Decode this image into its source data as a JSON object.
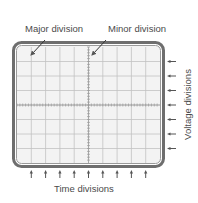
{
  "labels": {
    "major_division": "Major division",
    "minor_division": "Minor division",
    "time_divisions": "Time divisions",
    "voltage_divisions": "Voltage divisions"
  },
  "graticule": {
    "columns": 10,
    "rows": 8,
    "time_arrow_count": 9,
    "voltage_arrow_count": 7
  },
  "colors": {
    "bezel": "#6e6e6e",
    "screen": "#f3f3f3",
    "grid": "#bdbdbd",
    "text": "#4a4a4a",
    "arrow": "#555555"
  }
}
